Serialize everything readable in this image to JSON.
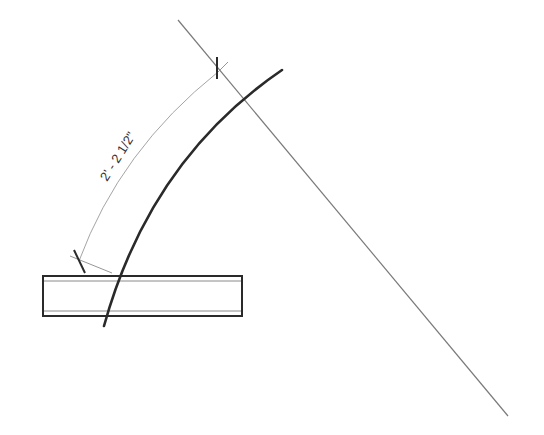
{
  "drawing": {
    "type": "architectural-plan-detail",
    "dimension": {
      "label": "2' - 2 1/2\"",
      "start_tick": [
        79,
        261
      ],
      "end_tick": [
        218,
        72
      ]
    },
    "reference_line": {
      "from": [
        178,
        20
      ],
      "to": [
        508,
        416
      ]
    },
    "curve": {
      "from": [
        104,
        326
      ],
      "ctrl": [
        150,
        160
      ],
      "to": [
        282,
        70
      ]
    },
    "beam": {
      "x": 43,
      "y": 276,
      "width": 199,
      "height": 40
    },
    "colors": {
      "line_heavy": "#2a2a2a",
      "line_thin": "#777777",
      "dim_line": "#999999",
      "text": "#333333",
      "background": "#ffffff"
    }
  }
}
